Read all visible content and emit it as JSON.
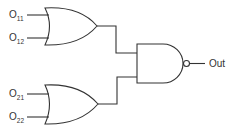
{
  "diagram": {
    "type": "logic-circuit",
    "gates": [
      {
        "id": "or1",
        "type": "OR",
        "inputs": [
          "O11",
          "O12"
        ]
      },
      {
        "id": "or2",
        "type": "OR",
        "inputs": [
          "O21",
          "O22"
        ]
      },
      {
        "id": "nand1",
        "type": "NAND",
        "inputs": [
          "or1",
          "or2"
        ],
        "output": "Out"
      }
    ],
    "labels": {
      "in11": {
        "base": "O",
        "sub": "11"
      },
      "in12": {
        "base": "O",
        "sub": "12"
      },
      "in21": {
        "base": "O",
        "sub": "21"
      },
      "in22": {
        "base": "O",
        "sub": "22"
      },
      "out": "Out"
    },
    "colors": {
      "line": "#333333",
      "background": "#ffffff"
    }
  }
}
